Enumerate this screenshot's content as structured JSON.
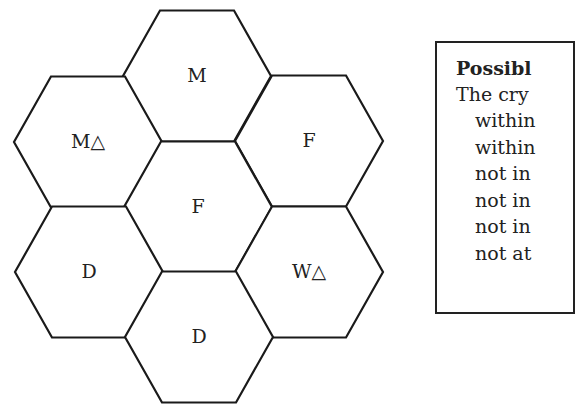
{
  "hexes": [
    {
      "id": "top",
      "label": "M",
      "cx": 197,
      "cy": 76
    },
    {
      "id": "upper-left",
      "label": "M△",
      "cx": 88,
      "cy": 142
    },
    {
      "id": "upper-right",
      "label": "F",
      "cx": 309,
      "cy": 141
    },
    {
      "id": "center",
      "label": "F",
      "cx": 198,
      "cy": 207
    },
    {
      "id": "lower-left",
      "label": "D",
      "cx": 89,
      "cy": 272
    },
    {
      "id": "lower-right",
      "label": "W△",
      "cx": 309,
      "cy": 272
    },
    {
      "id": "bottom",
      "label": "D",
      "cx": 199,
      "cy": 337
    }
  ],
  "clues": {
    "title": "Possible clues",
    "lines": [
      "The crystal is...",
      "within one space of...",
      "within two spaces of...",
      "not in...",
      "not in...",
      "not in...",
      "not at..."
    ],
    "visible_lines": [
      "The cry",
      "within",
      "within",
      "not in",
      "not in",
      "not in",
      "not at"
    ],
    "visible_title": "Possibl"
  },
  "colors": {
    "stroke": "#1a1a1a",
    "text": "#222222",
    "background": "#ffffff"
  }
}
